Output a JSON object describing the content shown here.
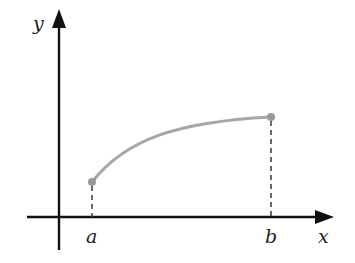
{
  "diagram": {
    "type": "function-graph",
    "axes": {
      "x_label": "x",
      "y_label": "y"
    },
    "markers": {
      "a_label": "a",
      "b_label": "b"
    },
    "curve": {
      "description": "increasing concave-down curve from (a, f(a)) to (b, f(b))",
      "color": "#a6a6a6"
    },
    "colors": {
      "axis": "#111111",
      "curve": "#a6a6a6",
      "endpoint": "#999999",
      "dashed": "#444444"
    }
  }
}
